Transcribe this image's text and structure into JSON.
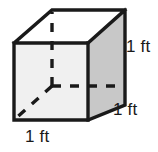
{
  "figure": {
    "name": "cube-diagram",
    "shape": "cube",
    "colors": {
      "outline": "#1a1a1a",
      "front_face": "#f0f0f0",
      "top_face": "#ffffff",
      "right_face": "#c8c8c8",
      "hidden_edge": "#1a1a1a",
      "label_text": "#1a1a1a",
      "background": "#ffffff"
    },
    "labels": {
      "height": "1 ft",
      "depth": "1 ft",
      "width": "1 ft"
    },
    "geometry": {
      "front_top_left": [
        14,
        43
      ],
      "front_top_right": [
        88,
        43
      ],
      "front_bottom_right": [
        88,
        120
      ],
      "front_bottom_left": [
        14,
        120
      ],
      "back_top_left": [
        52,
        10
      ],
      "back_top_right": [
        125,
        10
      ],
      "back_bottom_right": [
        125,
        105
      ],
      "back_bottom_left": [
        52,
        86
      ]
    }
  }
}
